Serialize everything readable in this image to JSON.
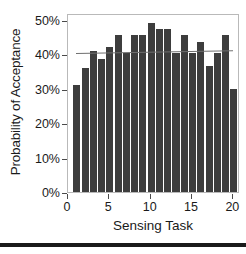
{
  "chart_data": {
    "type": "bar",
    "title": "",
    "subtitle": "",
    "xlabel": "Sensing Task",
    "ylabel": "Probability of Acceptance",
    "categories": [
      1,
      2,
      3,
      4,
      5,
      6,
      7,
      8,
      9,
      10,
      11,
      12,
      13,
      14,
      15,
      16,
      17,
      18,
      19,
      20
    ],
    "values": [
      31,
      36,
      41,
      38.5,
      42,
      45.5,
      40.5,
      45.5,
      45.5,
      49,
      47.5,
      47.5,
      40.5,
      45.5,
      40.5,
      43.5,
      36.5,
      40.5,
      45.5,
      30
    ],
    "value_unit": "%",
    "series": [
      {
        "name": "Probability of Acceptance",
        "values": [
          31,
          36,
          41,
          38.5,
          42,
          45.5,
          40.5,
          45.5,
          45.5,
          49,
          47.5,
          47.5,
          40.5,
          45.5,
          40.5,
          43.5,
          36.5,
          40.5,
          45.5,
          30
        ],
        "color": "#3d3d3d"
      }
    ],
    "trendline": {
      "name": "linear-fit",
      "x_start": 1,
      "x_end": 20,
      "y_start": 41.0,
      "y_end": 41.8,
      "color": "#6f6f6f"
    },
    "xlim": [
      0,
      20.8
    ],
    "ylim": [
      0,
      52
    ],
    "x_ticks": [
      0,
      5,
      10,
      15,
      20
    ],
    "x_tick_labels": [
      "0",
      "5",
      "10",
      "15",
      "20"
    ],
    "y_ticks": [
      0,
      10,
      20,
      30,
      40,
      50
    ],
    "y_tick_labels": [
      "0%",
      "10%",
      "20%",
      "30%",
      "40%",
      "50%"
    ],
    "grid": false,
    "legend": null,
    "legend_position": "none",
    "annotations": []
  },
  "axes": {
    "y_title": "Probability of Acceptance",
    "x_title": "Sensing Task",
    "y_tick_labels": [
      "50%",
      "40%",
      "30%",
      "20%",
      "10%",
      "0%"
    ],
    "x_tick_labels": [
      "0",
      "5",
      "10",
      "15",
      "20"
    ]
  },
  "colors": {
    "bar": "#3d3d3d",
    "trendline": "#6f6f6f",
    "frame": "#b9b9b9",
    "text": "#1a1a1a",
    "background": "#ffffff",
    "rule": "#1a1a1a"
  }
}
